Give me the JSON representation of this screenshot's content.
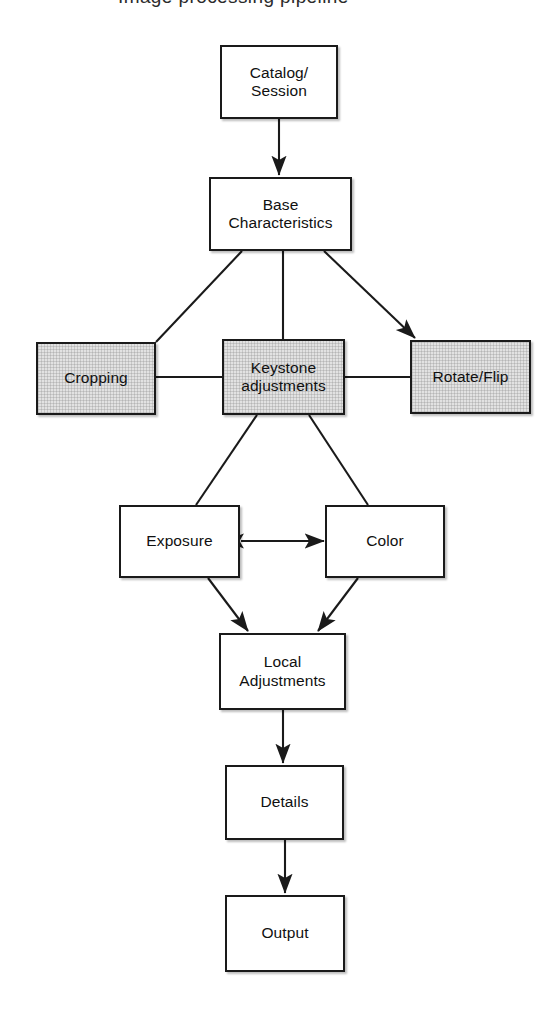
{
  "diagram": {
    "title_fragment": "Image processing pipeline",
    "background_color": "#ffffff",
    "stroke_color": "#1a1a1a",
    "shaded_fill_color": "#e2e2e2",
    "plain_fill_color": "#ffffff",
    "nodes": [
      {
        "id": "catalog",
        "label": "Catalog/\nSession",
        "shaded": false,
        "x": 220,
        "y": 45,
        "w": 118,
        "h": 74
      },
      {
        "id": "base",
        "label": "Base\nCharacteristics",
        "shaded": false,
        "x": 209,
        "y": 177,
        "w": 143,
        "h": 74
      },
      {
        "id": "cropping",
        "label": "Cropping",
        "shaded": true,
        "x": 36,
        "y": 342,
        "w": 120,
        "h": 73
      },
      {
        "id": "keystone",
        "label": "Keystone\nadjustments",
        "shaded": true,
        "x": 222,
        "y": 339,
        "w": 123,
        "h": 76
      },
      {
        "id": "rotate",
        "label": "Rotate/Flip",
        "shaded": true,
        "x": 410,
        "y": 340,
        "w": 121,
        "h": 74
      },
      {
        "id": "exposure",
        "label": "Exposure",
        "shaded": false,
        "x": 119,
        "y": 505,
        "w": 121,
        "h": 73
      },
      {
        "id": "color",
        "label": "Color",
        "shaded": false,
        "x": 325,
        "y": 505,
        "w": 120,
        "h": 73
      },
      {
        "id": "local",
        "label": "Local\nAdjustments",
        "shaded": false,
        "x": 219,
        "y": 633,
        "w": 127,
        "h": 77
      },
      {
        "id": "details",
        "label": "Details",
        "shaded": false,
        "x": 225,
        "y": 765,
        "w": 119,
        "h": 75
      },
      {
        "id": "output",
        "label": "Output",
        "shaded": false,
        "x": 225,
        "y": 895,
        "w": 120,
        "h": 77
      }
    ],
    "edges": [
      {
        "id": "catalog-to-base",
        "from": "catalog",
        "to": "base",
        "arrow": "end",
        "x1": 279,
        "y1": 119,
        "x2": 279,
        "y2": 175
      },
      {
        "id": "base-to-cropping",
        "from": "base",
        "to": "cropping",
        "arrow": "none",
        "x1": 242,
        "y1": 251,
        "x2": 156,
        "y2": 342
      },
      {
        "id": "base-to-keystone",
        "from": "base",
        "to": "keystone",
        "arrow": "none",
        "x1": 283,
        "y1": 251,
        "x2": 283,
        "y2": 339
      },
      {
        "id": "base-to-rotate",
        "from": "base",
        "to": "rotate",
        "arrow": "end",
        "x1": 324,
        "y1": 251,
        "x2": 415,
        "y2": 338
      },
      {
        "id": "cropping-to-keystone",
        "from": "cropping",
        "to": "keystone",
        "arrow": "none",
        "x1": 156,
        "y1": 377,
        "x2": 222,
        "y2": 377
      },
      {
        "id": "keystone-to-rotate",
        "from": "keystone",
        "to": "rotate",
        "arrow": "none",
        "x1": 345,
        "y1": 377,
        "x2": 410,
        "y2": 377
      },
      {
        "id": "keystone-to-exposure",
        "from": "keystone",
        "to": "exposure",
        "arrow": "none",
        "x1": 257,
        "y1": 415,
        "x2": 196,
        "y2": 505
      },
      {
        "id": "keystone-to-color",
        "from": "keystone",
        "to": "color",
        "arrow": "none",
        "x1": 309,
        "y1": 415,
        "x2": 368,
        "y2": 505
      },
      {
        "id": "exposure-to-color",
        "from": "exposure",
        "to": "color",
        "arrow": "both",
        "x1": 241,
        "y1": 541,
        "x2": 324,
        "y2": 541
      },
      {
        "id": "exposure-to-local",
        "from": "exposure",
        "to": "local",
        "arrow": "end",
        "x1": 208,
        "y1": 578,
        "x2": 248,
        "y2": 631
      },
      {
        "id": "color-to-local",
        "from": "color",
        "to": "local",
        "arrow": "end",
        "x1": 358,
        "y1": 578,
        "x2": 318,
        "y2": 631
      },
      {
        "id": "local-to-details",
        "from": "local",
        "to": "details",
        "arrow": "end",
        "x1": 283,
        "y1": 710,
        "x2": 283,
        "y2": 763
      },
      {
        "id": "details-to-output",
        "from": "details",
        "to": "output",
        "arrow": "end",
        "x1": 285,
        "y1": 840,
        "x2": 285,
        "y2": 893
      }
    ]
  }
}
